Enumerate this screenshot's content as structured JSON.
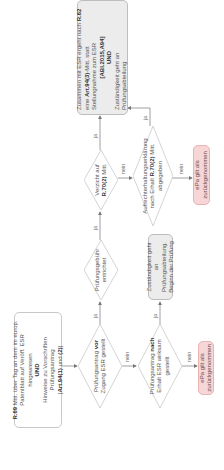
{
  "diagram": {
    "start": {
      "line1_bold": "R.69",
      "line1": " Mitt. über Tag an dem im europ. Patentblatt auf Veröff. ESR hingewiesen",
      "and": "UND",
      "line2": "Hinweise zu Vorschriften Prüfungsantrag",
      "line3_pre": "[",
      "line3_bold1": "Art.94(1)",
      "line3_mid": " und ",
      "line3_bold2": "(2)",
      "line3_post": "]"
    },
    "decision_vor": {
      "pre": "Prüfungsantrag ",
      "bold": "vor",
      "post": " Zugang ESR gestellt"
    },
    "decision_nach": {
      "pre": "Prüfungsantrag ",
      "bold": "nach",
      "post": " Erhalt ESR wirksam gestellt"
    },
    "decision_fee": {
      "text": "Prüfungsgebühr entrichtet"
    },
    "decision_verzicht": {
      "pre": "Verzicht auf ",
      "bold": "R.70(2)",
      "post": " Mitt."
    },
    "decision_aufrecht": {
      "pre": "Aufrechterhaltungserklärung nach Erhalt ",
      "bold": "R.70(2)",
      "post": " Mitt. abgegeben"
    },
    "box_zustaendigkeit": {
      "text": "Zuständigkeit geht an Prüfungsabteilung. Beginn der Prüfung"
    },
    "box_final": {
      "l1_pre": "Zusammen mit ESR ergeht nach ",
      "l1_bold": "R.62",
      "l2_pre": "eine ",
      "l2_bold": "Art.94(3)",
      "l2_post": "-Mitt. statt Stellungnahme zum ESR",
      "l3_bold": "[ABl.2015,A94]",
      "and": "UND",
      "l4": "Zuständigkeit geht an Prüfungsabteilung"
    },
    "terminal_bottom": {
      "text": "ePa gilt als zurückgenommen"
    },
    "terminal_top": {
      "text": "ePa gilt als zurückgenommen"
    },
    "edge_labels": {
      "ja": "ja",
      "nein": "nein"
    },
    "colors": {
      "terminal_fill": "#f6d6d6",
      "process_fill": "#ececec",
      "line": "#888888"
    }
  }
}
